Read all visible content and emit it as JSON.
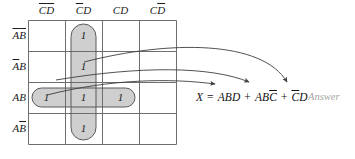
{
  "diagram": {
    "type": "karnaugh-map",
    "colors": {
      "grid_line": "#6e6e6e",
      "group_fill": "#cfcfcf",
      "group_stroke": "#5a5a5a",
      "arrow": "#3d3d3d",
      "text": "#1a1a1a",
      "answer_text": "#a6a6a6"
    },
    "columns": [
      {
        "id": "c0",
        "label_parts": [
          {
            "t": "C",
            "bar": true
          },
          {
            "t": "D",
            "bar": true
          }
        ]
      },
      {
        "id": "c1",
        "label_parts": [
          {
            "t": "C",
            "bar": true
          },
          {
            "t": "D",
            "bar": false
          }
        ]
      },
      {
        "id": "c2",
        "label_parts": [
          {
            "t": "C",
            "bar": false
          },
          {
            "t": "D",
            "bar": false
          }
        ]
      },
      {
        "id": "c3",
        "label_parts": [
          {
            "t": "C",
            "bar": false
          },
          {
            "t": "D",
            "bar": true
          }
        ]
      }
    ],
    "rows": [
      {
        "id": "r0",
        "label_parts": [
          {
            "t": "A",
            "bar": true
          },
          {
            "t": "B",
            "bar": true
          }
        ]
      },
      {
        "id": "r1",
        "label_parts": [
          {
            "t": "A",
            "bar": true
          },
          {
            "t": "B",
            "bar": false
          }
        ]
      },
      {
        "id": "r2",
        "label_parts": [
          {
            "t": "A",
            "bar": false
          },
          {
            "t": "B",
            "bar": false
          }
        ]
      },
      {
        "id": "r3",
        "label_parts": [
          {
            "t": "A",
            "bar": false
          },
          {
            "t": "B",
            "bar": true
          }
        ]
      }
    ],
    "cells": [
      {
        "row": 0,
        "col": 1,
        "value": "1"
      },
      {
        "row": 1,
        "col": 1,
        "value": "1"
      },
      {
        "row": 2,
        "col": 0,
        "value": "1"
      },
      {
        "row": 2,
        "col": 1,
        "value": "1"
      },
      {
        "row": 2,
        "col": 2,
        "value": "1"
      },
      {
        "row": 3,
        "col": 1,
        "value": "1"
      }
    ],
    "groups": [
      {
        "id": "group-vertical",
        "orientation": "vertical",
        "col": 1,
        "rows": [
          0,
          1,
          2,
          3
        ]
      },
      {
        "id": "group-horizontal",
        "orientation": "horizontal",
        "row": 2,
        "cols": [
          0,
          1,
          2
        ]
      }
    ],
    "arrows": [
      {
        "id": "arrow-to-term-1",
        "target_term": "ABD"
      },
      {
        "id": "arrow-to-term-2",
        "target_term": "ABC̅"
      },
      {
        "id": "arrow-to-term-3",
        "target_term": "C̅D"
      }
    ]
  },
  "equation": {
    "lhs": "X",
    "equals": "=",
    "terms": [
      {
        "parts": [
          {
            "t": "A",
            "bar": false
          },
          {
            "t": "B",
            "bar": false
          },
          {
            "t": "D",
            "bar": false
          }
        ]
      },
      {
        "parts": [
          {
            "t": "A",
            "bar": false
          },
          {
            "t": "B",
            "bar": false
          },
          {
            "t": "C",
            "bar": true
          }
        ]
      },
      {
        "parts": [
          {
            "t": "C",
            "bar": true
          },
          {
            "t": "D",
            "bar": false
          }
        ]
      }
    ],
    "plus": "+",
    "text_plain": "X = ABD + ABC̅ + C̅D"
  },
  "annotation": {
    "answer_label": "Answer"
  }
}
